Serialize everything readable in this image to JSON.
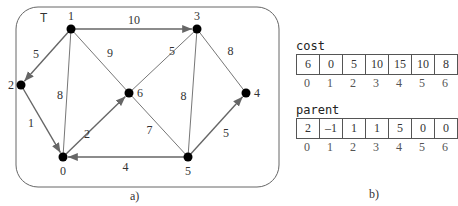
{
  "panel_a": {
    "label": "T",
    "caption": "a)",
    "nodes": [
      {
        "id": "0",
        "x": 63,
        "y": 157
      },
      {
        "id": "1",
        "x": 71,
        "y": 29
      },
      {
        "id": "2",
        "x": 21,
        "y": 85
      },
      {
        "id": "3",
        "x": 197,
        "y": 29
      },
      {
        "id": "4",
        "x": 246,
        "y": 93
      },
      {
        "id": "5",
        "x": 188,
        "y": 157
      },
      {
        "id": "6",
        "x": 129,
        "y": 93
      }
    ],
    "edges": [
      {
        "from": "1",
        "to": "3",
        "weight": "10",
        "tree": true
      },
      {
        "from": "1",
        "to": "2",
        "weight": "5",
        "tree": true
      },
      {
        "from": "1",
        "to": "6",
        "weight": "9",
        "tree": false
      },
      {
        "from": "1",
        "to": "0",
        "weight": "8",
        "tree": false
      },
      {
        "from": "2",
        "to": "0",
        "weight": "1",
        "tree": true
      },
      {
        "from": "0",
        "to": "6",
        "weight": "2",
        "tree": true
      },
      {
        "from": "5",
        "to": "0",
        "weight": "4",
        "tree": true
      },
      {
        "from": "6",
        "to": "3",
        "weight": "5",
        "tree": false
      },
      {
        "from": "6",
        "to": "5",
        "weight": "7",
        "tree": false
      },
      {
        "from": "3",
        "to": "5",
        "weight": "8",
        "tree": false
      },
      {
        "from": "3",
        "to": "4",
        "weight": "8",
        "tree": false
      },
      {
        "from": "5",
        "to": "4",
        "weight": "5",
        "tree": true
      }
    ]
  },
  "panel_b": {
    "caption": "b)",
    "cost": {
      "title": "cost",
      "values": [
        "6",
        "0",
        "5",
        "10",
        "15",
        "10",
        "8"
      ],
      "indices": [
        "0",
        "1",
        "2",
        "3",
        "4",
        "5",
        "6"
      ]
    },
    "parent": {
      "title": "parent",
      "values": [
        "2",
        "–1",
        "1",
        "1",
        "5",
        "0",
        "0"
      ],
      "indices": [
        "0",
        "1",
        "2",
        "3",
        "4",
        "5",
        "6"
      ]
    }
  }
}
